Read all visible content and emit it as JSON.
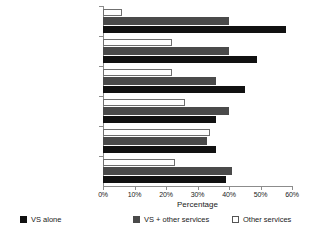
{
  "chart_data": {
    "type": "bar",
    "orientation": "horizontal",
    "title": "",
    "xlabel": "Percentage",
    "ylabel": "",
    "xlim": [
      0,
      60
    ],
    "grid": false,
    "legend_position": "bottom",
    "xtick_labels": [
      "0%",
      "10%",
      "20%",
      "30%",
      "40%",
      "50%",
      "60%"
    ],
    "xticks": [
      0,
      10,
      20,
      30,
      40,
      50,
      60
    ],
    "categories": [
      "Use of veterinary\nmedicinal products",
      "Distribution of veterinary\nmedicinal products",
      "Production of veterinary\nmedicinal products",
      "Animal feed produced\non the farm",
      "Animal feed distribution",
      "Animal feed production"
    ],
    "series": [
      {
        "name": "VS alone",
        "color": "#111111",
        "values": [
          58,
          49,
          45,
          36,
          36,
          39
        ]
      },
      {
        "name": "VS + other services",
        "color": "#4a4a4a",
        "values": [
          40,
          40,
          36,
          40,
          33,
          41
        ]
      },
      {
        "name": "Other services",
        "color": "#ffffff",
        "values": [
          6,
          22,
          22,
          26,
          34,
          23
        ]
      }
    ]
  },
  "legend": {
    "items": [
      {
        "label": "VS alone",
        "swatch": "black"
      },
      {
        "label": "VS + other services",
        "swatch": "gray"
      },
      {
        "label": "Other services",
        "swatch": "white"
      }
    ]
  },
  "axis": {
    "x_title": "Percentage"
  }
}
